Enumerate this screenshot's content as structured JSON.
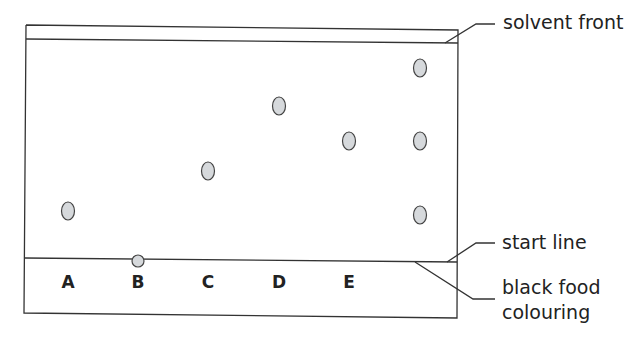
{
  "diagram": {
    "type": "paper chromatography",
    "annotations": {
      "solvent_front": "solvent front",
      "start_line": "start line",
      "black_food_colouring": "black food colouring",
      "black_food_colouring_line1": "black food",
      "black_food_colouring_line2": "colouring"
    },
    "lanes": [
      {
        "label": "A",
        "x": 68,
        "spots_y": [
          211
        ]
      },
      {
        "label": "B",
        "x": 138,
        "spots_y": [
          261
        ]
      },
      {
        "label": "C",
        "x": 208,
        "spots_y": [
          171
        ]
      },
      {
        "label": "D",
        "x": 279,
        "spots_y": [
          106
        ]
      },
      {
        "label": "E",
        "x": 349,
        "spots_y": [
          141
        ]
      },
      {
        "label": "",
        "x": 420,
        "spots_y": [
          68,
          141,
          215
        ]
      }
    ],
    "colors": {
      "line": "#333333",
      "spot_fill": "#d6d9dc",
      "spot_stroke": "#444444"
    }
  }
}
